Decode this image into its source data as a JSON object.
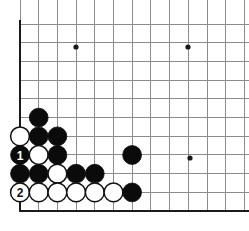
{
  "board": {
    "title": "Go board diagram",
    "kind": "go-board-corner-diagram",
    "background_color": "#ffffff",
    "grid_color": "#8c8c8c",
    "edge_color": "#1a1a1a",
    "black_color": "#0b0b0b",
    "white_color": "#ffffff",
    "geometry": {
      "origin_x": 20,
      "origin_y": 211,
      "cell": 18.7,
      "columns_visible": 13,
      "rows_visible": 11,
      "stone_radius": 9.4,
      "left_edge_x": 20,
      "bottom_edge_y": 211,
      "top_cut_y": 20,
      "right_cut_x": 249
    },
    "star_points": [
      {
        "name": "star-point-left",
        "col": 4,
        "row": 9,
        "cx": 76,
        "cy": 47
      },
      {
        "name": "star-point-right",
        "col": 10,
        "row": 9,
        "cx": 188,
        "cy": 47
      },
      {
        "name": "star-point-lower-right",
        "col": 10,
        "row": 3,
        "cx": 190,
        "cy": 158
      }
    ],
    "stones": [
      {
        "id": "b-c2-r6",
        "color": "black",
        "col": 2,
        "row": 6,
        "cx": 38.7,
        "cy": 117.6,
        "label": ""
      },
      {
        "id": "w-c1-r5",
        "color": "white",
        "col": 1,
        "row": 5,
        "cx": 20,
        "cy": 136.3,
        "label": ""
      },
      {
        "id": "b-c2-r5",
        "color": "black",
        "col": 2,
        "row": 5,
        "cx": 38.7,
        "cy": 136.3,
        "label": ""
      },
      {
        "id": "b-c3-r5",
        "color": "black",
        "col": 3,
        "row": 5,
        "cx": 57.4,
        "cy": 136.3,
        "label": ""
      },
      {
        "id": "b-c1-r4",
        "color": "black",
        "col": 1,
        "row": 4,
        "cx": 20,
        "cy": 155,
        "label": "1"
      },
      {
        "id": "w-c2-r4",
        "color": "white",
        "col": 2,
        "row": 4,
        "cx": 38.7,
        "cy": 155,
        "label": ""
      },
      {
        "id": "b-c3-r4",
        "color": "black",
        "col": 3,
        "row": 4,
        "cx": 57.4,
        "cy": 155,
        "label": ""
      },
      {
        "id": "b-c7-r4",
        "color": "black",
        "col": 7,
        "row": 4,
        "cx": 132.1,
        "cy": 155,
        "label": ""
      },
      {
        "id": "b-c1-r3",
        "color": "black",
        "col": 1,
        "row": 3,
        "cx": 20,
        "cy": 173.7,
        "label": ""
      },
      {
        "id": "b-c2-r3",
        "color": "black",
        "col": 2,
        "row": 3,
        "cx": 38.7,
        "cy": 173.7,
        "label": ""
      },
      {
        "id": "w-c3-r3",
        "color": "white",
        "col": 3,
        "row": 3,
        "cx": 57.4,
        "cy": 173.7,
        "label": ""
      },
      {
        "id": "b-c4-r3",
        "color": "black",
        "col": 4,
        "row": 3,
        "cx": 76.1,
        "cy": 173.7,
        "label": ""
      },
      {
        "id": "b-c5-r3",
        "color": "black",
        "col": 5,
        "row": 3,
        "cx": 94.8,
        "cy": 173.7,
        "label": ""
      },
      {
        "id": "w-c1-r2",
        "color": "white",
        "col": 1,
        "row": 2,
        "cx": 20,
        "cy": 192.4,
        "label": "2"
      },
      {
        "id": "w-c2-r2",
        "color": "white",
        "col": 2,
        "row": 2,
        "cx": 38.7,
        "cy": 192.4,
        "label": ""
      },
      {
        "id": "w-c3-r2",
        "color": "white",
        "col": 3,
        "row": 2,
        "cx": 57.4,
        "cy": 192.4,
        "label": ""
      },
      {
        "id": "w-c4-r2",
        "color": "white",
        "col": 4,
        "row": 2,
        "cx": 76.1,
        "cy": 192.4,
        "label": ""
      },
      {
        "id": "w-c5-r2",
        "color": "white",
        "col": 5,
        "row": 2,
        "cx": 94.8,
        "cy": 192.4,
        "label": ""
      },
      {
        "id": "w-c6-r2",
        "color": "white",
        "col": 6,
        "row": 2,
        "cx": 113.5,
        "cy": 192.4,
        "label": ""
      },
      {
        "id": "b-c7-r2",
        "color": "black",
        "col": 7,
        "row": 2,
        "cx": 132.1,
        "cy": 192.4,
        "label": ""
      }
    ],
    "move_markers": [
      {
        "number": "1",
        "color": "black",
        "cx": 20,
        "cy": 155
      },
      {
        "number": "2",
        "color": "white",
        "cx": 20,
        "cy": 192.4
      }
    ]
  }
}
